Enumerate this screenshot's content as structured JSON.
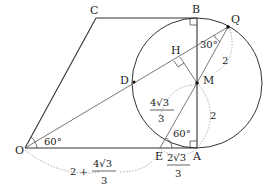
{
  "diagram": {
    "type": "geometry",
    "points": {
      "O": {
        "label": "O",
        "x": 25,
        "y": 148
      },
      "A": {
        "label": "A",
        "x": 197,
        "y": 148
      },
      "B": {
        "label": "B",
        "x": 197,
        "y": 18
      },
      "C": {
        "label": "C",
        "x": 96,
        "y": 18
      },
      "Q": {
        "label": "Q",
        "x": 228,
        "y": 27
      },
      "M": {
        "label": "M",
        "x": 197,
        "y": 83
      },
      "H": {
        "label": "H",
        "x": 180,
        "y": 57
      },
      "D": {
        "label": "D",
        "x": 134,
        "y": 82
      },
      "E": {
        "label": "E",
        "x": 160,
        "y": 148
      }
    },
    "circle": {
      "center": "M",
      "radius": 65
    },
    "angles": {
      "at_O": "60°",
      "at_Q": "30°",
      "at_E": "60°"
    },
    "lengths": {
      "MQ": "2",
      "MA": "2",
      "ME_num": "4√3",
      "ME_den": "3",
      "EA_num": "2√3",
      "EA_den": "3",
      "OA_prefix": "2 +",
      "OA_num": "4√3",
      "OA_den": "3"
    }
  }
}
